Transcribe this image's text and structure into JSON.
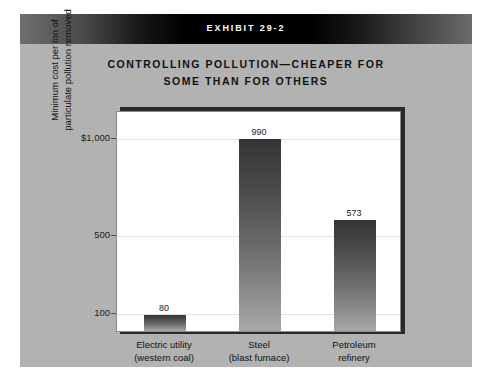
{
  "exhibit": {
    "banner_label": "EXHIBIT 29-2",
    "background_color": "#b2b2b2"
  },
  "chart_data": {
    "type": "bar",
    "title": "CONTROLLING POLLUTION—CHEAPER FOR SOME THAN FOR OTHERS",
    "title_line1": "CONTROLLING POLLUTION—CHEAPER FOR",
    "title_line2": "SOME THAN FOR OTHERS",
    "categories": [
      "Electric utility (western coal)",
      "Steel (blast furnace)",
      "Petroleum refinery"
    ],
    "category_lines": [
      [
        "Electric utility",
        "(western coal)"
      ],
      [
        "Steel",
        "(blast furnace)"
      ],
      [
        "Petroleum",
        "refinery"
      ]
    ],
    "values": [
      80,
      990,
      573
    ],
    "value_labels": [
      "80",
      "990",
      "573"
    ],
    "xlabel": "",
    "ylabel": "Minimum cost per ton of particulate pollution removed",
    "ylabel_line1": "Minimum cost per ton of",
    "ylabel_line2": "particulate pollution removed",
    "ytick_labels": [
      "$1,000",
      "500",
      "100"
    ],
    "ytick_values": [
      1000,
      500,
      100
    ],
    "ylim": [
      0,
      1140
    ],
    "grid": true,
    "legend": "none",
    "bar_color_top": "#343434",
    "bar_color_bottom": "#a8a8a8"
  }
}
